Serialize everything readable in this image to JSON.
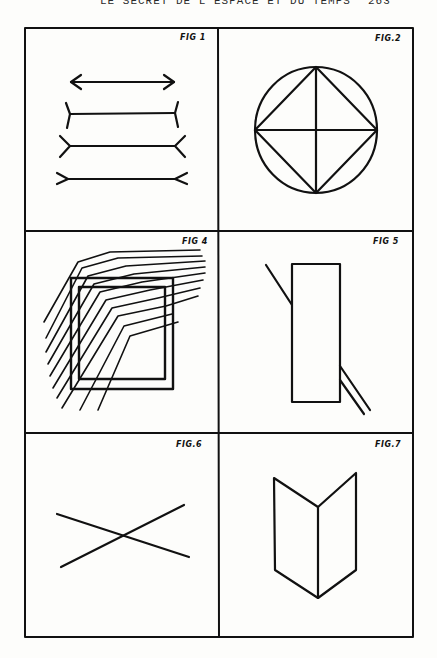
{
  "page": {
    "running_head": "LE SECRET DE L'ESPACE ET DU TEMPS",
    "page_number": "263",
    "ink_color": "#111111",
    "paper_color": "#fdfdfb"
  },
  "plate": {
    "layout": "3 rows x 2 columns",
    "figures": [
      {
        "label": "FIG 1",
        "description": "Müller-Lyer illusion: double-headed arrow and three horizontal lines with differing end fins"
      },
      {
        "label": "FIG.2",
        "description": "Circle with inscribed square (diamond) and crossing diameters"
      },
      {
        "label": "FIG 4",
        "description": "Two nested squares overlaid with bent parallel diagonal hatch lines"
      },
      {
        "label": "FIG 5",
        "description": "Tall rectangle interrupted by an oblique line (Poggendorff illusion)"
      },
      {
        "label": "FIG.6",
        "description": "Two straight lines crossing in an X"
      },
      {
        "label": "FIG.7",
        "description": "Folded card / open book shape (ambiguous perspective figure)"
      }
    ]
  }
}
